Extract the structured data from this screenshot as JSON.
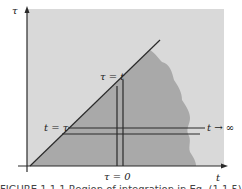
{
  "diagram": {
    "axes": {
      "vertical_label": "τ",
      "horizontal_label": "t"
    },
    "labels": {
      "diagonal_top": "τ = t",
      "diagonal_left": "t = τ",
      "bottom_vertical_strip": "τ = 0",
      "right_horizontal_strip": "t → ∞"
    },
    "caption": "FIGURE 1.1.1  Region of integration in Eq. (1.1.5)",
    "colors": {
      "background_region": "#d9d9d9",
      "integration_region": "#a9a9a9",
      "lines": "#2a2a2a"
    }
  }
}
